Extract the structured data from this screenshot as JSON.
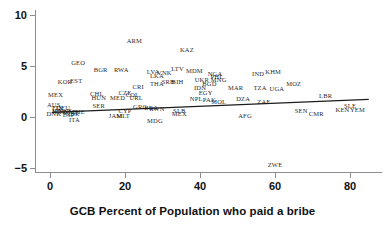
{
  "chart": {
    "type": "scatter",
    "x_axis_title": "GCB Percent of Population who paid a bribe",
    "y_axis_title": "",
    "title": "",
    "x_ticks": [
      "0",
      "20",
      "40",
      "60",
      "80"
    ],
    "y_ticks": [
      "10",
      "5",
      "0",
      "−5"
    ]
  },
  "chart_data": {
    "type": "scatter",
    "title": "",
    "xlabel": "GCB Percent of Population who paid a bribe",
    "ylabel": "",
    "xlim": [
      -4,
      90
    ],
    "ylim": [
      -6.5,
      11
    ],
    "xticks": [
      0,
      20,
      40,
      60,
      80
    ],
    "yticks": [
      -5,
      0,
      5,
      10
    ],
    "grid": false,
    "legend": null,
    "point_marker": "text-label",
    "note": "Each data point is drawn as the country's ISO-3 code rather than a dot.",
    "trendline": {
      "type": "linear",
      "x_start": 0.5,
      "y_start": 0.45,
      "x_end": 85.0,
      "y_end": 1.72,
      "color": "#1c1c1c"
    },
    "points": [
      {
        "label": "ARM",
        "x": 22.5,
        "y": 7.5
      },
      {
        "label": "KAZ",
        "x": 36.5,
        "y": 6.6
      },
      {
        "label": "GEO",
        "x": 7.5,
        "y": 5.3
      },
      {
        "label": "BGR",
        "x": 13.5,
        "y": 4.6
      },
      {
        "label": "RWA",
        "x": 19.0,
        "y": 4.6
      },
      {
        "label": "LTV",
        "x": 34.0,
        "y": 4.7
      },
      {
        "label": "MDM",
        "x": 38.5,
        "y": 4.5
      },
      {
        "label": "LVA",
        "x": 27.5,
        "y": 4.4
      },
      {
        "label": "LKA",
        "x": 28.5,
        "y": 4.0
      },
      {
        "label": "VNK",
        "x": 30.5,
        "y": 4.3
      },
      {
        "label": "NGA",
        "x": 44.0,
        "y": 4.2
      },
      {
        "label": "PHL",
        "x": 44.5,
        "y": 3.9
      },
      {
        "label": "MNG",
        "x": 45.0,
        "y": 3.6
      },
      {
        "label": "IND",
        "x": 55.5,
        "y": 4.2
      },
      {
        "label": "KHM",
        "x": 59.5,
        "y": 4.4
      },
      {
        "label": "UKR",
        "x": 40.5,
        "y": 3.6
      },
      {
        "label": "BGD",
        "x": 42.5,
        "y": 3.2
      },
      {
        "label": "KOR",
        "x": 4.0,
        "y": 3.4
      },
      {
        "label": "EST",
        "x": 7.0,
        "y": 3.5
      },
      {
        "label": "SRB",
        "x": 31.5,
        "y": 3.4
      },
      {
        "label": "BIH",
        "x": 34.0,
        "y": 3.4
      },
      {
        "label": "THA",
        "x": 28.5,
        "y": 3.2
      },
      {
        "label": "CRI",
        "x": 23.5,
        "y": 2.9
      },
      {
        "label": "IDN",
        "x": 40.0,
        "y": 2.8
      },
      {
        "label": "MOZ",
        "x": 65.0,
        "y": 3.2
      },
      {
        "label": "MAR",
        "x": 49.5,
        "y": 2.8
      },
      {
        "label": "TZA",
        "x": 56.0,
        "y": 2.8
      },
      {
        "label": "UGA",
        "x": 60.5,
        "y": 2.7
      },
      {
        "label": "EGY",
        "x": 41.5,
        "y": 2.4
      },
      {
        "label": "LBR",
        "x": 73.5,
        "y": 2.1
      },
      {
        "label": "MEX",
        "x": 1.5,
        "y": 2.2
      },
      {
        "label": "CHL",
        "x": 12.5,
        "y": 2.3
      },
      {
        "label": "CZE",
        "x": 20.0,
        "y": 2.4
      },
      {
        "label": "COL",
        "x": 22.0,
        "y": 2.2
      },
      {
        "label": "HUN",
        "x": 13.0,
        "y": 1.9
      },
      {
        "label": "MED",
        "x": 18.0,
        "y": 1.9
      },
      {
        "label": "URL",
        "x": 23.0,
        "y": 1.9
      },
      {
        "label": "NPL",
        "x": 39.0,
        "y": 1.8
      },
      {
        "label": "PAK",
        "x": 42.5,
        "y": 1.7
      },
      {
        "label": "MOL",
        "x": 45.0,
        "y": 1.5
      },
      {
        "label": "DZA",
        "x": 51.5,
        "y": 1.8
      },
      {
        "label": "ZAF",
        "x": 57.0,
        "y": 1.5
      },
      {
        "label": "SLE",
        "x": 80.0,
        "y": 1.1
      },
      {
        "label": "SEN",
        "x": 67.0,
        "y": 0.6
      },
      {
        "label": "CMR",
        "x": 71.0,
        "y": 0.3
      },
      {
        "label": "KEN",
        "x": 78.0,
        "y": 0.7
      },
      {
        "label": "YEM",
        "x": 82.0,
        "y": 0.7
      },
      {
        "label": "SER",
        "x": 13.0,
        "y": 1.1
      },
      {
        "label": "GRC",
        "x": 24.0,
        "y": 1.0
      },
      {
        "label": "BRA",
        "x": 27.0,
        "y": 0.9
      },
      {
        "label": "RWN",
        "x": 28.5,
        "y": 0.8
      },
      {
        "label": "CYP",
        "x": 20.0,
        "y": 0.6
      },
      {
        "label": "SLB",
        "x": 34.5,
        "y": 0.6
      },
      {
        "label": "MEX",
        "x": 34.5,
        "y": 0.3
      },
      {
        "label": "AFG",
        "x": 52.0,
        "y": 0.1
      },
      {
        "label": "MDG",
        "x": 28.0,
        "y": -0.4
      },
      {
        "label": "AUS",
        "x": 1.0,
        "y": 1.2
      },
      {
        "label": "FIN",
        "x": 2.0,
        "y": 0.9
      },
      {
        "label": "DEU",
        "x": 3.5,
        "y": 0.9
      },
      {
        "label": "JPN",
        "x": 2.0,
        "y": 0.6
      },
      {
        "label": "NOR",
        "x": 2.5,
        "y": 0.5
      },
      {
        "label": "SWE",
        "x": 4.0,
        "y": 0.6
      },
      {
        "label": "DNK",
        "x": 1.0,
        "y": 0.3
      },
      {
        "label": "NLD",
        "x": 5.5,
        "y": 0.5
      },
      {
        "label": "CHE",
        "x": 7.5,
        "y": 0.5
      },
      {
        "label": "GBR",
        "x": 6.0,
        "y": 0.3
      },
      {
        "label": "ESP",
        "x": 5.0,
        "y": 0.2
      },
      {
        "label": "ITA",
        "x": 6.5,
        "y": -0.3
      },
      {
        "label": "JAM",
        "x": 17.5,
        "y": 0.1
      },
      {
        "label": "MLT",
        "x": 19.5,
        "y": 0.1
      },
      {
        "label": "ZWE",
        "x": 60.0,
        "y": -4.7
      }
    ]
  }
}
